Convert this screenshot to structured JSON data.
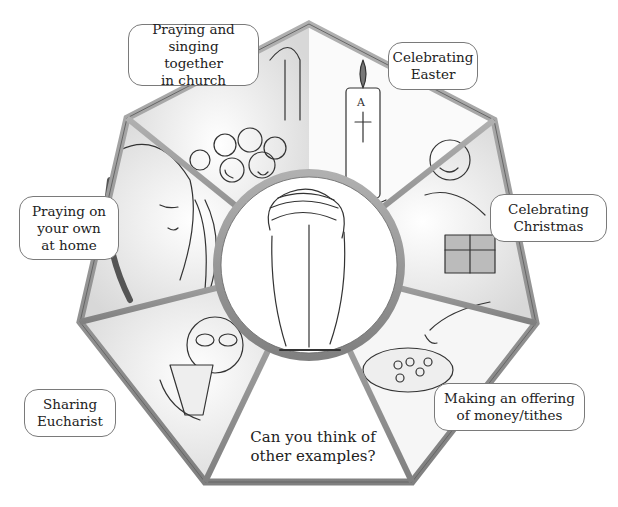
{
  "diagram": {
    "center": {
      "image": "praying-hands-icon"
    },
    "segments": [
      {
        "id": "church",
        "label": "Praying and\nsinging together\nin church",
        "image": "singing-congregation"
      },
      {
        "id": "easter",
        "label": "Celebrating\nEaster",
        "image": "paschal-candle"
      },
      {
        "id": "christmas",
        "label": "Celebrating\nChristmas",
        "image": "gift-giving"
      },
      {
        "id": "offering",
        "label": "Making an offering\nof money/tithes",
        "image": "offering-plate"
      },
      {
        "id": "question",
        "label": "Can you think of\nother examples?",
        "image": ""
      },
      {
        "id": "eucharist",
        "label": "Sharing\nEucharist",
        "image": "woman-drinking-cup"
      },
      {
        "id": "home",
        "label": "Praying on\nyour own\nat home",
        "image": "woman-praying"
      }
    ],
    "colors": {
      "frame": "#9a9a9a",
      "frame_dark": "#6e6e6e",
      "panel": "#f4f4f4",
      "label_border": "#7a7a7a",
      "text": "#222222"
    }
  }
}
